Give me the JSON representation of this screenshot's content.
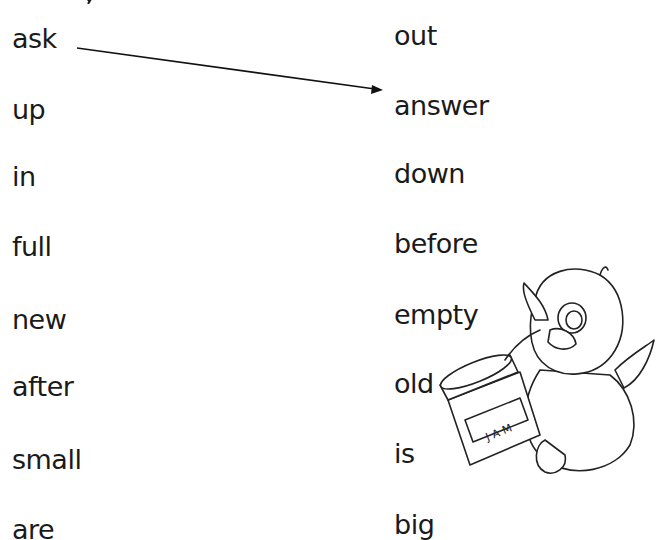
{
  "worksheet": {
    "left_column": [
      "ask",
      "up",
      "in",
      "full",
      "new",
      "after",
      "small",
      "are"
    ],
    "right_column": [
      "out",
      "answer",
      "down",
      "before",
      "empty",
      "old",
      "is",
      "big"
    ],
    "example_match": {
      "from": "ask",
      "to": "answer"
    },
    "illustration": {
      "subject": "penguin holding jam jar",
      "jar_label": "JAM"
    }
  }
}
